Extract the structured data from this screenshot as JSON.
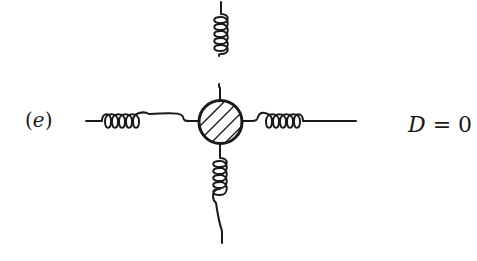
{
  "diagram": {
    "type": "Feynman diagram",
    "panel": {
      "open": "(",
      "letter": "e",
      "close": ")"
    },
    "degree": {
      "symbol": "D",
      "relation": " = ",
      "value": "0"
    },
    "vertex": {
      "shape": "circle",
      "fill": "hatched",
      "hatch_lines": 4
    },
    "external_legs": [
      {
        "direction": "up",
        "type": "gluon",
        "coils": 5
      },
      {
        "direction": "down",
        "type": "gluon",
        "coils": 5
      },
      {
        "direction": "left",
        "type": "gluon",
        "coils": 5
      },
      {
        "direction": "right",
        "type": "gluon",
        "coils": 5
      }
    ],
    "colors": {
      "stroke": "#1a1a1a",
      "background": "#ffffff"
    }
  }
}
